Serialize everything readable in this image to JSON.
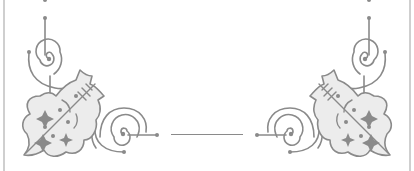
{
  "page": {
    "colors": {
      "stroke": "#8a8a8a",
      "fill_light": "#ececec",
      "frame": "#cfcfcf",
      "background": "#ffffff"
    },
    "elements": {
      "left_ornament": "ornament-flourish",
      "right_ornament": "ornament-flourish-mirrored",
      "divider": "horizontal-rule"
    }
  }
}
